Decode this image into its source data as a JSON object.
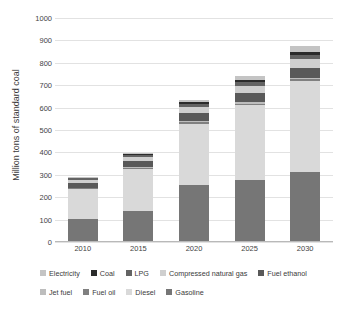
{
  "chart_data": {
    "type": "bar",
    "subtype": "stacked-vertical",
    "title": "",
    "xlabel": "",
    "ylabel": "Million tons of standard coal",
    "categories": [
      "2010",
      "2015",
      "2020",
      "2025",
      "2030"
    ],
    "ylim": [
      0,
      1000
    ],
    "ytick_step": 100,
    "yticks": [
      "1000",
      "900",
      "800",
      "700",
      "600",
      "500",
      "400",
      "300",
      "200",
      "100",
      "0"
    ],
    "grid": true,
    "grid_axis": "y",
    "legend_position": "bottom",
    "stack_order_bottom_to_top": [
      "Gasoline",
      "Diesel",
      "Fuel oil",
      "Jet fuel",
      "Fuel ethanol",
      "Compressed natural gas",
      "LPG",
      "Coal",
      "Electricity"
    ],
    "series": [
      {
        "name": "Gasoline",
        "color": "#767676",
        "values": [
          103,
          139,
          254,
          279,
          312
        ]
      },
      {
        "name": "Diesel",
        "color": "#d9d9d9",
        "values": [
          133,
          185,
          275,
          333,
          409
        ]
      },
      {
        "name": "Fuel oil",
        "color": "#808080",
        "values": [
          4,
          5,
          6,
          6,
          6
        ]
      },
      {
        "name": "Jet fuel",
        "color": "#bdbdbd",
        "values": [
          3,
          4,
          5,
          5,
          5
        ]
      },
      {
        "name": "Fuel ethanol",
        "color": "#595959",
        "values": [
          22,
          28,
          38,
          42,
          47
        ]
      },
      {
        "name": "Compressed natural gas",
        "color": "#cfcfcf",
        "values": [
          12,
          18,
          26,
          33,
          40
        ]
      },
      {
        "name": "LPG",
        "color": "#636363",
        "values": [
          8,
          10,
          13,
          15,
          17
        ]
      },
      {
        "name": "Coal",
        "color": "#2b2b2b",
        "values": [
          3,
          5,
          7,
          9,
          11
        ]
      },
      {
        "name": "Electricity",
        "color": "#c4c4c4",
        "values": [
          2,
          5,
          9,
          18,
          30
        ]
      }
    ],
    "totals": [
      290,
      399,
      633,
      740,
      877
    ]
  },
  "legend": {
    "rows": [
      [
        {
          "label": "Electricity",
          "color": "#c4c4c4"
        },
        {
          "label": "Coal",
          "color": "#2b2b2b"
        },
        {
          "label": "LPG",
          "color": "#636363"
        },
        {
          "label": "Compressed natural gas",
          "color": "#cfcfcf"
        },
        {
          "label": "Fuel ethanol",
          "color": "#595959"
        }
      ],
      [
        {
          "label": "Jet fuel",
          "color": "#bdbdbd"
        },
        {
          "label": "Fuel oil",
          "color": "#808080"
        },
        {
          "label": "Diesel",
          "color": "#d9d9d9"
        },
        {
          "label": "Gasoline",
          "color": "#767676"
        }
      ]
    ]
  },
  "colors": {
    "background": "#ffffff",
    "gridline": "#e2e2e2",
    "axis": "#b9b9b9",
    "text": "#3a3a3a"
  }
}
